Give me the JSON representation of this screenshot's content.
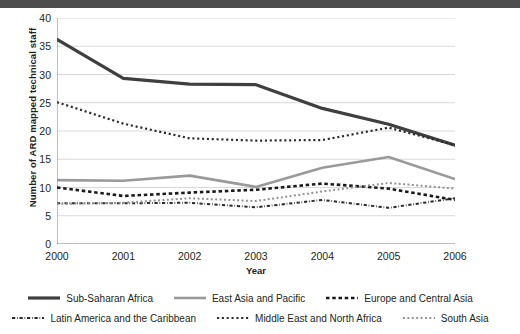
{
  "chart_data": {
    "type": "line",
    "title": "",
    "xlabel": "Year",
    "ylabel": "Number of ARD mapped technical staff",
    "x": [
      2000,
      2001,
      2002,
      2003,
      2004,
      2005,
      2006
    ],
    "categories": [
      "2000",
      "2001",
      "2002",
      "2003",
      "2004",
      "2005",
      "2006"
    ],
    "xlim": [
      2000,
      2006
    ],
    "ylim": [
      0,
      40
    ],
    "yticks": [
      0,
      5,
      10,
      15,
      20,
      25,
      30,
      35,
      40
    ],
    "grid": "horizontal",
    "legend_position": "bottom",
    "series": [
      {
        "name": "Sub-Saharan Africa",
        "values": [
          36.2,
          29.3,
          28.3,
          28.2,
          24.0,
          21.2,
          17.5
        ],
        "color": "#3f3f3f",
        "style": "solid",
        "width": 3.2
      },
      {
        "name": "East Asia and Pacific",
        "values": [
          11.3,
          11.2,
          12.1,
          10.1,
          13.5,
          15.4,
          11.5
        ],
        "color": "#9a9a9a",
        "style": "solid",
        "width": 2.6
      },
      {
        "name": "Europe and Central Asia",
        "values": [
          10.0,
          8.5,
          9.1,
          9.6,
          10.7,
          9.8,
          7.8
        ],
        "color": "#1a1a1a",
        "style": "square-dash",
        "width": 2.6
      },
      {
        "name": "Latin America and the Caribbean",
        "values": [
          7.2,
          7.2,
          7.3,
          6.5,
          7.8,
          6.4,
          8.1
        ],
        "color": "#2b2b2b",
        "style": "dash-dot",
        "width": 2.0
      },
      {
        "name": "Middle East and North Africa",
        "values": [
          25.1,
          21.3,
          18.7,
          18.3,
          18.4,
          20.6,
          17.5
        ],
        "color": "#2b2b2b",
        "style": "dotted",
        "width": 2.2
      },
      {
        "name": "South Asia",
        "values": [
          7.1,
          7.3,
          8.1,
          7.6,
          9.3,
          10.8,
          9.8
        ],
        "color": "#8f8f8f",
        "style": "dotted",
        "width": 2.0
      }
    ]
  }
}
